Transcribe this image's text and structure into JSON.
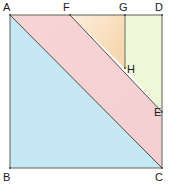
{
  "figure": {
    "square": {
      "corners": {
        "A": {
          "label": "A",
          "x": 10,
          "y": 15
        },
        "B": {
          "label": "B",
          "x": 10,
          "y": 168
        },
        "C": {
          "label": "C",
          "x": 162,
          "y": 168
        },
        "D": {
          "label": "D",
          "x": 162,
          "y": 15
        }
      },
      "side_length_px": 152
    },
    "points": {
      "F": {
        "label": "F",
        "x": 70,
        "y": 15,
        "on": "top-edge-AD"
      },
      "G": {
        "label": "G",
        "x": 125,
        "y": 15,
        "on": "top-edge-AD"
      },
      "H": {
        "label": "H",
        "x": 125,
        "y": 68,
        "on": "segment-FE"
      },
      "E": {
        "label": "E",
        "x": 162,
        "y": 112,
        "on": "right-edge-DC"
      }
    },
    "segments": [
      {
        "name": "side-AD",
        "from": "A",
        "to": "D"
      },
      {
        "name": "side-DC",
        "from": "D",
        "to": "C"
      },
      {
        "name": "side-CB",
        "from": "C",
        "to": "B"
      },
      {
        "name": "side-BA",
        "from": "B",
        "to": "A"
      },
      {
        "name": "diagonal-AC",
        "from": "A",
        "to": "C"
      },
      {
        "name": "segment-FE",
        "from": "F",
        "to": "E"
      },
      {
        "name": "segment-GH",
        "from": "G",
        "to": "H"
      }
    ],
    "regions": [
      {
        "name": "triangle-ABC",
        "fill": "#c6e8f5",
        "vertices": "A,B,C"
      },
      {
        "name": "parallelogram-AFEC",
        "fill": "#f6d2d2",
        "vertices": "A,F,E,C"
      },
      {
        "name": "triangle-FGH",
        "fill_start": "#fae6cc",
        "fill_end": "#f6d9b4",
        "vertices": "F,G,H"
      },
      {
        "name": "quad-GDEH",
        "fill": "#eef8d8",
        "vertices": "G,D,E,H"
      }
    ],
    "colors": {
      "blue": "#c6e8f5",
      "pink": "#f6d2d2",
      "orange": "#fae6cc",
      "green": "#eef8d8",
      "stroke": "#6b6f63",
      "thin_stroke": "#4a4a4a",
      "label": "#1a1a1a",
      "background": "#ffffff"
    }
  },
  "labels": {
    "A": "A",
    "B": "B",
    "C": "C",
    "D": "D",
    "E": "E",
    "F": "F",
    "G": "G",
    "H": "H"
  }
}
